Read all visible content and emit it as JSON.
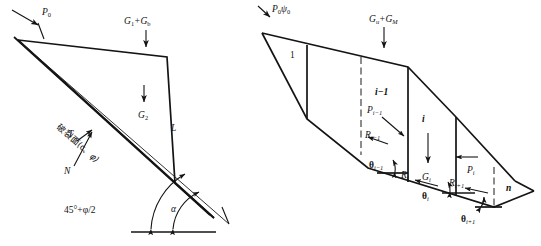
{
  "figure": {
    "background_color": "#ffffff",
    "line_color": "#141414",
    "panels": [
      {
        "id": "left-panel",
        "name": "single-wedge-limit-equilibrium",
        "labels": {
          "surcharge": "P",
          "surcharge_sub": "0",
          "weight_top": "G",
          "weight_top_sub": "1",
          "weight_top_plus": "+G",
          "weight_top_sub2": "b",
          "weight_mid": "G",
          "weight_mid_sub": "2",
          "slip_surface_cjk": "破裂面(c、",
          "slip_surface_phi": "φ)",
          "shear_force": "T",
          "normal_force": "N",
          "slip_length": "L",
          "angle_base": "45°+φ/2",
          "angle_alpha": "α"
        }
      },
      {
        "id": "right-panel",
        "name": "multi-slice-limit-equilibrium",
        "labels": {
          "surcharge": "P",
          "surcharge_sub": "0",
          "surcharge_psi": "ψ",
          "surcharge_psi_sub": "0",
          "weight_top": "G",
          "weight_top_sub": "u",
          "weight_top_plus": "+G",
          "weight_top_sub2": "M",
          "slice_first": "1",
          "slice_prev": "i−1",
          "slice_cur": "i",
          "slice_last": "n",
          "thrust_prev": "P",
          "thrust_prev_sub": "i−1",
          "thrust_cur": "P",
          "thrust_cur_sub": "i",
          "reaction_prev": "R",
          "reaction_prev_sub": "i−1",
          "reaction_cur": "R",
          "reaction_cur_sub": "i",
          "reaction_next": "R",
          "reaction_next_sub": "i+1",
          "weight_slice": "G",
          "weight_slice_sub": "i",
          "theta_prev": "θ",
          "theta_prev_sub": "i−1",
          "theta_cur": "θ",
          "theta_cur_sub": "i",
          "theta_next": "θ",
          "theta_next_sub": "i+1"
        }
      }
    ]
  }
}
